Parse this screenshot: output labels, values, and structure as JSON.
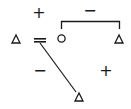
{
  "diagram": {
    "type": "kinship-relations",
    "colors": {
      "ink": "#1a1a1a",
      "background": "#ffffff"
    },
    "symbols": [
      {
        "id": "male-left",
        "shape": "triangle",
        "x": 16,
        "y": 39
      },
      {
        "id": "female",
        "shape": "circle",
        "x": 61,
        "y": 38
      },
      {
        "id": "male-right",
        "shape": "triangle",
        "x": 119,
        "y": 39
      },
      {
        "id": "male-bottom",
        "shape": "triangle",
        "x": 79,
        "y": 97
      }
    ],
    "signs": [
      {
        "id": "sign-top-left",
        "label": "+",
        "x": 39,
        "y": 13
      },
      {
        "id": "sign-top-right",
        "label": "−",
        "x": 90,
        "y": 11
      },
      {
        "id": "sign-bottom-left",
        "label": "−",
        "x": 40,
        "y": 71
      },
      {
        "id": "sign-bottom-right",
        "label": "+",
        "x": 106,
        "y": 71
      }
    ],
    "marriage_sign": "="
  }
}
